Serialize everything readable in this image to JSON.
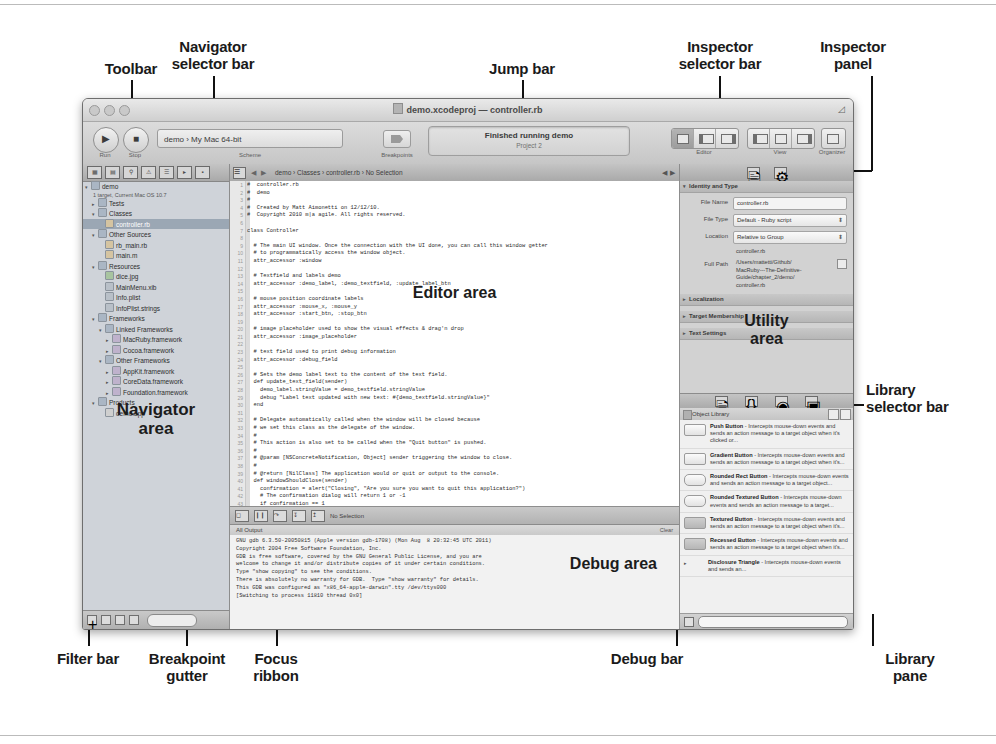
{
  "figure": {
    "callouts": [
      {
        "id": "toolbar",
        "label": "Toolbar"
      },
      {
        "id": "navigator-selector-bar",
        "label": "Navigator\nselector bar"
      },
      {
        "id": "jump-bar",
        "label": "Jump bar"
      },
      {
        "id": "inspector-selector-bar",
        "label": "Inspector\nselector bar"
      },
      {
        "id": "inspector-panel",
        "label": "Inspector\npanel"
      },
      {
        "id": "library-selector-bar",
        "label": "Library\nselector bar"
      },
      {
        "id": "library-pane",
        "label": "Library\npane"
      },
      {
        "id": "debug-bar",
        "label": "Debug bar"
      },
      {
        "id": "focus-ribbon",
        "label": "Focus\nribbon"
      },
      {
        "id": "breakpoint-gutter",
        "label": "Breakpoint\ngutter"
      },
      {
        "id": "filter-bar",
        "label": "Filter bar"
      }
    ],
    "area_labels": {
      "navigator": "Navigator\narea",
      "editor": "Editor area",
      "utility": "Utility\narea",
      "debug": "Debug area"
    }
  },
  "window": {
    "title": "demo.xcodeproj — controller.rb",
    "traffic_lights": [
      "close-button",
      "minimize-button",
      "zoom-button"
    ]
  },
  "toolbar": {
    "run_label": "Run",
    "stop_label": "Stop",
    "scheme_label": "Scheme",
    "scheme_value": "demo  ›  My Mac 64-bit",
    "breakpoints_label": "Breakpoints",
    "status_line1": "Finished running demo",
    "status_line2": "Project    2",
    "editor_label": "Editor",
    "view_label": "View",
    "organizer_label": "Organizer"
  },
  "navigator": {
    "selector_icons": [
      "project-navigator-icon",
      "symbol-navigator-icon",
      "search-navigator-icon",
      "issue-navigator-icon",
      "test-navigator-icon",
      "debug-navigator-icon",
      "breakpoint-navigator-icon",
      "log-navigator-icon"
    ],
    "project_name": "demo",
    "project_subtitle": "1 target, Current Mac OS 10.7",
    "tree": [
      {
        "label": "Tests",
        "depth": 1,
        "kind": "folder",
        "twisty": "▸"
      },
      {
        "label": "Classes",
        "depth": 1,
        "kind": "folder",
        "twisty": "▾"
      },
      {
        "label": "controller.rb",
        "depth": 2,
        "kind": "rb",
        "twisty": "",
        "selected": true
      },
      {
        "label": "Other Sources",
        "depth": 1,
        "kind": "folder",
        "twisty": "▾"
      },
      {
        "label": "rb_main.rb",
        "depth": 2,
        "kind": "rb",
        "twisty": ""
      },
      {
        "label": "main.m",
        "depth": 2,
        "kind": "rb",
        "twisty": ""
      },
      {
        "label": "Resources",
        "depth": 1,
        "kind": "folder",
        "twisty": "▾"
      },
      {
        "label": "dice.jpg",
        "depth": 2,
        "kind": "img",
        "twisty": ""
      },
      {
        "label": "MainMenu.xib",
        "depth": 2,
        "kind": "file",
        "twisty": ""
      },
      {
        "label": "Info.plist",
        "depth": 2,
        "kind": "file",
        "twisty": ""
      },
      {
        "label": "InfoPlist.strings",
        "depth": 2,
        "kind": "file",
        "twisty": ""
      },
      {
        "label": "Frameworks",
        "depth": 1,
        "kind": "folder",
        "twisty": "▾"
      },
      {
        "label": "Linked Frameworks",
        "depth": 2,
        "kind": "folder",
        "twisty": "▾"
      },
      {
        "label": "MacRuby.framework",
        "depth": 3,
        "kind": "fw",
        "twisty": "▸"
      },
      {
        "label": "Cocoa.framework",
        "depth": 3,
        "kind": "fw",
        "twisty": "▸"
      },
      {
        "label": "Other Frameworks",
        "depth": 2,
        "kind": "folder",
        "twisty": "▾"
      },
      {
        "label": "AppKit.framework",
        "depth": 3,
        "kind": "fw",
        "twisty": "▸"
      },
      {
        "label": "CoreData.framework",
        "depth": 3,
        "kind": "fw",
        "twisty": "▸"
      },
      {
        "label": "Foundation.framework",
        "depth": 3,
        "kind": "fw",
        "twisty": "▸"
      },
      {
        "label": "Products",
        "depth": 1,
        "kind": "folder",
        "twisty": "▾"
      },
      {
        "label": "demo.app",
        "depth": 2,
        "kind": "app",
        "twisty": ""
      }
    ],
    "filter_bar_icons": [
      "add-icon",
      "recent-filter-icon",
      "source-control-filter-icon",
      "unsaved-filter-icon"
    ],
    "filter_placeholder": ""
  },
  "jump_bar": {
    "crumbs": "demo  ›   Classes  ›   controller.rb  ›  No Selection",
    "back_arrow": "◀",
    "forward_arrow": "▶",
    "prev_arrow": "◀",
    "next_arrow": "▶"
  },
  "editor": {
    "first_line_number": 1,
    "code": "#  controller.rb\n#  demo\n#\n#  Created by Matt Aimonetti on 12/12/10.\n#  Copyright 2010 m|a agile. All rights reserved.\n\nclass Controller\n\n  # The main UI window. Once the connection with the UI done, you can call this window getter\n  # to programmatically access the window object.\n  attr_accessor :window\n\n  # Textfield and labels demo\n  attr_accessor :demo_label, :demo_textfield, :update_label_btn\n\n  # mouse position coordinate labels\n  attr_accessor :mouse_x, :mouse_y\n  attr_accessor :start_btn, :stop_btn\n\n  # image placeholder used to show the visual effects & drag'n drop\n  attr_accessor :image_placeholder\n\n  # text field used to print debug information\n  attr_accessor :debug_field\n\n  # Sets the demo label text to the content of the text field.\n  def update_text_field(sender)\n    demo_label.stringValue = demo_textfield.stringValue\n    debug \"Label text updated with new text: #{demo_textfield.stringValue}\"\n  end\n\n  # Delegate automatically called when the window will be closed because\n  # we set this class as the delegate of the window.\n  #\n  # This action is also set to be called when the \"Quit button\" is pushed.\n  #\n  # @param [NSConcreteNotification, Object] sender triggering the window to close.\n  #\n  # @return [NilClass] The application would or quit or output to the console.\n  def windowShouldClose(sender)\n    confirmation = alert(\"Closing\", \"Are you sure you want to quit this application?\")\n    # The confirmation dialog will return 1 or -1\n    if confirmation == 1\n      exit\n    else\n      # For Objective-C developer, this is the same as writing the following Obj-C code:\n      # NSLog(@\"Ok, nevermind\")\n      puts \"Ok, nevermind\"\n      debug \"Not quitting after all\"\n    end"
  },
  "debug": {
    "bar_icons": [
      "hide-debug-area-icon",
      "pause-icon",
      "step-over-icon",
      "step-into-icon",
      "step-out-icon"
    ],
    "thread_popup": "No Selection",
    "console_title": "All Output",
    "console_right": "Clear",
    "console_text": "GNU gdb 6.3.50-20050815 (Apple version gdb-1708) (Mon Aug  8 20:32:45 UTC 2011)\nCopyright 2004 Free Software Foundation, Inc.\nGDB is free software, covered by the GNU General Public License, and you are\nwelcome to change it and/or distribute copies of it under certain conditions.\nType \"show copying\" to see the conditions.\nThere is absolutely no warranty for GDB.  Type \"show warranty\" for details.\nThis GDB was configured as \"x86_64-apple-darwin\".tty /dev/ttys000\n[Switching to process 11810 thread 0x0]"
  },
  "inspector": {
    "selector_icons": [
      "file-inspector-icon",
      "quick-help-inspector-icon"
    ],
    "section_title": "Identity and Type",
    "rows": [
      {
        "label": "File Name",
        "value": "controller.rb",
        "type": "text"
      },
      {
        "label": "File Type",
        "value": "Default - Ruby script",
        "type": "popup"
      },
      {
        "label": "Location",
        "value": "Relative to Group",
        "type": "popup"
      },
      {
        "label": "",
        "value": "controller.rb",
        "type": "subfile"
      },
      {
        "label": "Full Path",
        "value": "/Users/mattetti/Github/\nMacRuby---The-Definitive-\nGuide/chapter_2/demo/\ncontroller.rb",
        "type": "path"
      }
    ],
    "collapsed_sections": [
      "Localization",
      "Target Membership",
      "Text Settings"
    ]
  },
  "library": {
    "selector_icons": [
      "file-template-library-icon",
      "code-snippet-library-icon",
      "object-library-icon",
      "media-library-icon"
    ],
    "header_title": "Object Library",
    "items": [
      {
        "name": "Push Button",
        "desc": " - Intercepts mouse-down events and sends an action message to a target object when it's clicked or...",
        "thumb": "push"
      },
      {
        "name": "Gradient Button",
        "desc": " - Intercepts mouse-down events and sends an action message to a target object when it's...",
        "thumb": "gradient"
      },
      {
        "name": "Rounded Rect Button",
        "desc": " - Intercepts mouse-down events and sends an action message to a target object...",
        "thumb": "round"
      },
      {
        "name": "Rounded Textured Button",
        "desc": " - Intercepts mouse-down events and sends an action message to a target...",
        "thumb": "round"
      },
      {
        "name": "Textured Button",
        "desc": " - Intercepts mouse-down events and sends an action message to a target object when it's...",
        "thumb": "textured"
      },
      {
        "name": "Recessed Button",
        "desc": " - Intercepts mouse-down events and sends an action message to a target object when it's...",
        "thumb": "recessed"
      },
      {
        "name": "Disclosure Triangle",
        "desc": " - Intercepts mouse-down events and sends an...",
        "thumb": "tri"
      }
    ],
    "filter_placeholder": ""
  }
}
